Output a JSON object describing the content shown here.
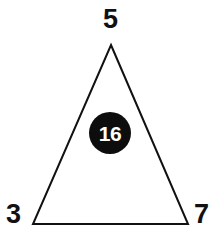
{
  "diagram": {
    "type": "triangle-with-center-value",
    "background_color": "#ffffff",
    "stroke_color": "#111111",
    "badge_fill_color": "#0d0d0d",
    "badge_text_color": "#ffffff",
    "shape": {
      "name": "triangle",
      "points": "111,45 188,224 33,224"
    },
    "vertices": [
      {
        "position": "top",
        "label": "5"
      },
      {
        "position": "bottom-left",
        "label": "3"
      },
      {
        "position": "bottom-right",
        "label": "7"
      }
    ],
    "center": {
      "label": "16"
    }
  }
}
